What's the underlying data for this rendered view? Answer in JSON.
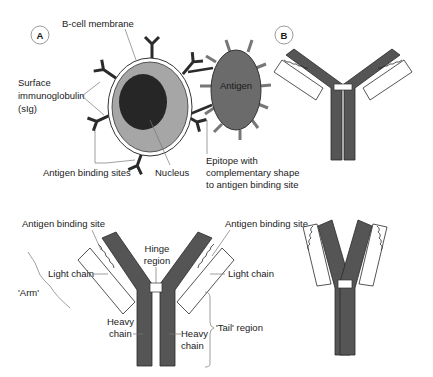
{
  "panels": {
    "a": {
      "marker": "A",
      "labels": {
        "b_cell_membrane": "B-cell membrane",
        "surface_ig_line1": "Surface",
        "surface_ig_line2": "immunoglobulin",
        "surface_ig_line3": "(sIg)",
        "antigen_binding_sites": "Antigen binding sites",
        "nucleus": "Nucleus",
        "antigen": "Antigen",
        "epitope_line1": "Epitope with",
        "epitope_line2": "complementary shape",
        "epitope_line3": "to antigen binding site"
      }
    },
    "b": {
      "marker": "B"
    },
    "c": {
      "labels": {
        "antigen_binding_site_left": "Antigen binding site",
        "antigen_binding_site_right": "Antigen binding site",
        "hinge_line1": "Hinge",
        "hinge_line2": "region",
        "light_chain_left": "Light chain",
        "light_chain_right": "Light chain",
        "arm": "'Arm'",
        "heavy_chain_left_line1": "Heavy",
        "heavy_chain_left_line2": "chain",
        "heavy_chain_right_line1": "Heavy",
        "heavy_chain_right_line2": "chain",
        "tail_region": "'Tail' region"
      }
    }
  },
  "colors": {
    "heavy_chain": "#555555",
    "cell_cytoplasm": "#a6a6a6",
    "nucleus": "#262626",
    "antigen": "#6b6b6b",
    "light_chain": "#ffffff"
  }
}
